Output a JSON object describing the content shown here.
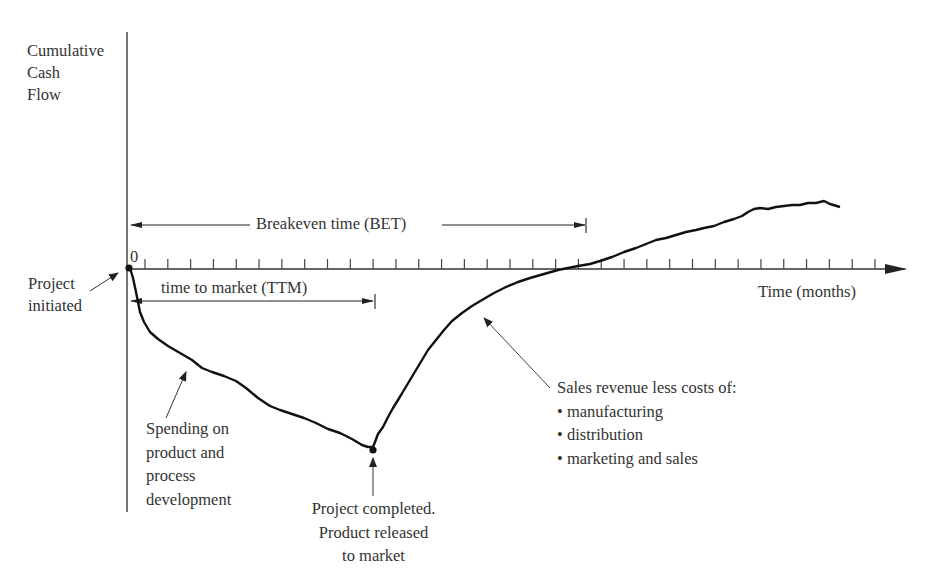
{
  "diagram": {
    "y_axis_label": [
      "Cumulative",
      "Cash",
      "Flow"
    ],
    "x_axis_label": "Time (months)",
    "origin_label": "0",
    "bet_label": "Breakeven time (BET)",
    "ttm_label": "time to market (TTM)",
    "annotations": {
      "project_initiated": [
        "Project",
        "initiated"
      ],
      "spending": [
        "Spending on",
        "product and",
        "process",
        "development"
      ],
      "project_completed": [
        "Project completed.",
        "Product released",
        "to market"
      ],
      "sales": {
        "heading": "Sales revenue less costs of:",
        "items": [
          "• manufacturing",
          "• distribution",
          "• marketing and sales"
        ]
      }
    },
    "colors": {
      "line": "#111111",
      "axis": "#555555",
      "text": "#333333",
      "background": "#ffffff"
    }
  },
  "chart_data": {
    "type": "line",
    "xlabel": "Time (months)",
    "ylabel": "Cumulative Cash Flow",
    "x_ticks": 33,
    "series": [
      {
        "name": "Cumulative cash flow",
        "points_description": "Starts at 0 at project initiation, declines during development to a minimum at product release (≈TTM), then rises, crossing zero at breakeven time (BET), and continues rising to the right.",
        "key_points": [
          {
            "label": "Project initiated",
            "x": 0,
            "y": 0
          },
          {
            "label": "Project completed / product released (TTM)",
            "x": 16,
            "y": -1.0
          },
          {
            "label": "Breakeven (BET)",
            "x": 30,
            "y": 0
          }
        ]
      }
    ],
    "annotations": [
      "Breakeven time (BET)",
      "time to market (TTM)"
    ]
  }
}
